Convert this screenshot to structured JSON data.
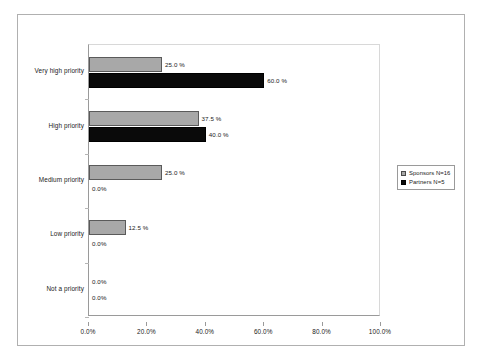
{
  "chart_data": {
    "type": "bar",
    "orientation": "horizontal",
    "title": "",
    "xlabel": "",
    "ylabel": "",
    "xlim": [
      0,
      100
    ],
    "xticks": [
      "0.0%",
      "20.0%",
      "40.0%",
      "60.0%",
      "80.0%",
      "100.0%"
    ],
    "xtick_values": [
      0,
      20,
      40,
      60,
      80,
      100
    ],
    "grid": false,
    "legend_position": "middle-right",
    "categories": [
      "Very high priority",
      "High priority",
      "Medium priority",
      "Low priority",
      "Not a priority"
    ],
    "series": [
      {
        "name": "Sponsors N=16",
        "color": "#a8a8a8",
        "values": [
          25.0,
          37.5,
          25.0,
          12.5,
          0.0
        ],
        "labels": [
          "25.0 %",
          "37.5 %",
          "25.0 %",
          "12.5 %",
          "0.0%"
        ]
      },
      {
        "name": "Partners  N=5",
        "color": "#0a0a0a",
        "values": [
          60.0,
          40.0,
          0.0,
          0.0,
          0.0
        ],
        "labels": [
          "60.0 %",
          "40.0 %",
          "0.0%",
          "0.0%",
          "0.0%"
        ]
      }
    ]
  },
  "legend": {
    "items": [
      {
        "label": "Sponsors N=16"
      },
      {
        "label": "Partners  N=5"
      }
    ]
  }
}
